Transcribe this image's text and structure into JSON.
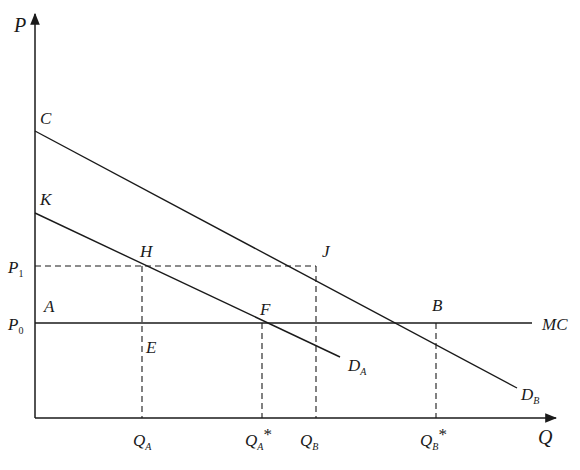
{
  "diagram": {
    "type": "economics-demand-supply",
    "axes": {
      "y_label": "P",
      "x_label": "Q"
    },
    "points": {
      "C": "C",
      "K": "K",
      "H": "H",
      "J": "J",
      "A": "A",
      "F": "F",
      "E": "E",
      "B": "B"
    },
    "price_levels": {
      "p1": {
        "main": "P",
        "sub": "1"
      },
      "p0": {
        "main": "P",
        "sub": "0"
      }
    },
    "curves": {
      "mc": "MC",
      "da": {
        "main": "D",
        "sub": "A"
      },
      "db": {
        "main": "D",
        "sub": "B"
      }
    },
    "quantities": {
      "qa": {
        "main": "Q",
        "sub": "A",
        "star": ""
      },
      "qa_star": {
        "main": "Q",
        "sub": "A",
        "star": "*"
      },
      "qb": {
        "main": "Q",
        "sub": "B",
        "star": ""
      },
      "qb_star": {
        "main": "Q",
        "sub": "B",
        "star": "*"
      }
    },
    "colors": {
      "line": "#1a1a1a",
      "background": "#ffffff"
    }
  }
}
